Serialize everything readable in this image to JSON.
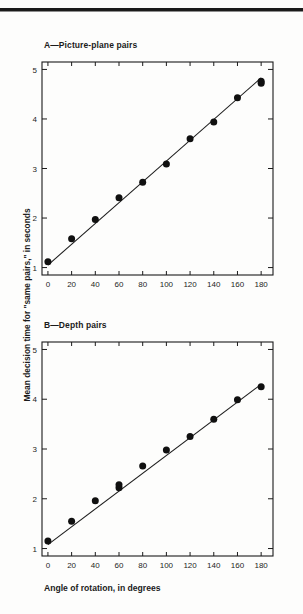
{
  "page": {
    "top_rule_color": "#1a1a1a",
    "background": "#fdfdfc"
  },
  "axes": {
    "y_label": "Mean decision time for \"same pairs,\" in seconds",
    "x_label": "Angle of rotation, in degrees"
  },
  "chart_data": [
    {
      "type": "scatter",
      "title": "A—Picture-plane pairs",
      "xlabel": "Angle of rotation, in degrees",
      "ylabel": "Mean decision time for \"same pairs,\" in seconds",
      "xlim": [
        -5,
        190
      ],
      "ylim": [
        0.85,
        5.15
      ],
      "xticks": [
        0,
        20,
        40,
        60,
        80,
        100,
        120,
        140,
        160,
        180
      ],
      "xtick_labels": [
        "0",
        "20",
        "40",
        "60",
        "80",
        "100",
        "120",
        "140",
        "160",
        "180"
      ],
      "yticks": [
        1,
        2,
        3,
        4,
        5
      ],
      "ytick_labels": [
        "1",
        "2",
        "3",
        "4",
        "5"
      ],
      "grid": false,
      "legend": null,
      "marker": "filled-circle",
      "marker_color": "#101010",
      "line_color": "#1a1a1a",
      "x": [
        0,
        20,
        40,
        60,
        80,
        100,
        120,
        140,
        160,
        180,
        180
      ],
      "y": [
        1.12,
        1.58,
        1.97,
        2.41,
        2.72,
        3.09,
        3.6,
        3.94,
        4.43,
        4.72,
        4.76
      ],
      "fit_line": {
        "x": [
          0,
          180
        ],
        "y": [
          1.05,
          4.83
        ],
        "intercept": 1.05,
        "slope_per_degree": 0.021
      }
    },
    {
      "type": "scatter",
      "title": "B—Depth pairs",
      "xlabel": "Angle of rotation, in degrees",
      "ylabel": "Mean decision time for \"same pairs,\" in seconds",
      "xlim": [
        -5,
        190
      ],
      "ylim": [
        0.85,
        5.15
      ],
      "xticks": [
        0,
        20,
        40,
        60,
        80,
        100,
        120,
        140,
        160,
        180
      ],
      "xtick_labels": [
        "0",
        "20",
        "40",
        "60",
        "80",
        "100",
        "120",
        "140",
        "160",
        "180"
      ],
      "yticks": [
        1,
        2,
        3,
        4,
        5
      ],
      "ytick_labels": [
        "1",
        "2",
        "3",
        "4",
        "5"
      ],
      "grid": false,
      "legend": null,
      "marker": "filled-circle",
      "marker_color": "#101010",
      "line_color": "#1a1a1a",
      "x": [
        0,
        20,
        40,
        60,
        60,
        80,
        100,
        120,
        140,
        160,
        180
      ],
      "y": [
        1.15,
        1.55,
        1.96,
        2.22,
        2.28,
        2.66,
        2.98,
        3.25,
        3.6,
        3.99,
        4.25
      ],
      "fit_line": {
        "x": [
          0,
          180
        ],
        "y": [
          1.08,
          4.3
        ],
        "intercept": 1.08,
        "slope_per_degree": 0.0179
      }
    }
  ]
}
